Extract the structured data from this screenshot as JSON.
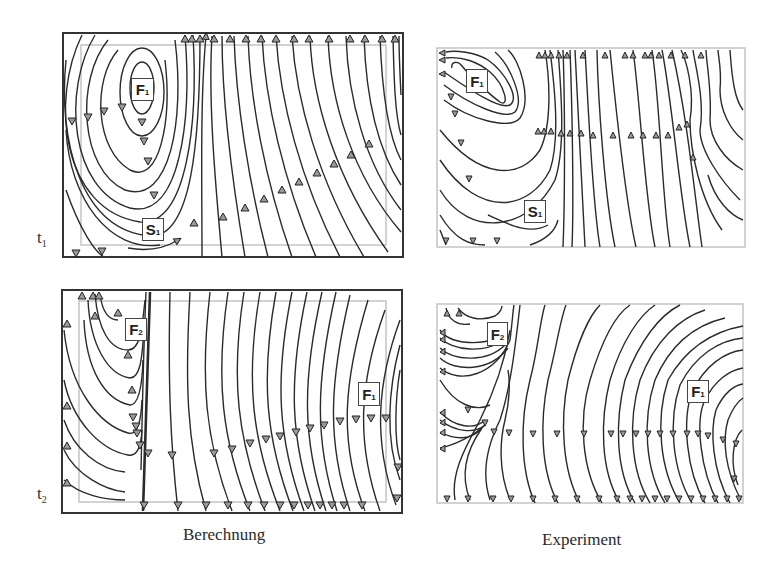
{
  "figure": {
    "type": "streamline-comparison",
    "columns": [
      {
        "id": "calc",
        "caption": "Berechnung"
      },
      {
        "id": "exp",
        "caption": "Experiment"
      }
    ],
    "rows": [
      {
        "id": "t1",
        "label_main": "t",
        "label_sub": "1"
      },
      {
        "id": "t2",
        "label_main": "t",
        "label_sub": "2"
      }
    ],
    "panels": {
      "calc_t1": {
        "labels": [
          {
            "main": "F",
            "sub": "1"
          },
          {
            "main": "S",
            "sub": "1"
          }
        ]
      },
      "exp_t1": {
        "labels": [
          {
            "main": "F",
            "sub": "1"
          },
          {
            "main": "S",
            "sub": "1"
          }
        ]
      },
      "calc_t2": {
        "labels": [
          {
            "main": "F",
            "sub": "2"
          },
          {
            "main": "F",
            "sub": "1"
          }
        ]
      },
      "exp_t2": {
        "labels": [
          {
            "main": "F",
            "sub": "2"
          },
          {
            "main": "F",
            "sub": "1"
          }
        ]
      }
    },
    "colors": {
      "line": "#2b2b2b",
      "frame": "#333333",
      "inner_frame": "#bdbdbd",
      "arrow_fill": "#9a9a9a"
    }
  }
}
